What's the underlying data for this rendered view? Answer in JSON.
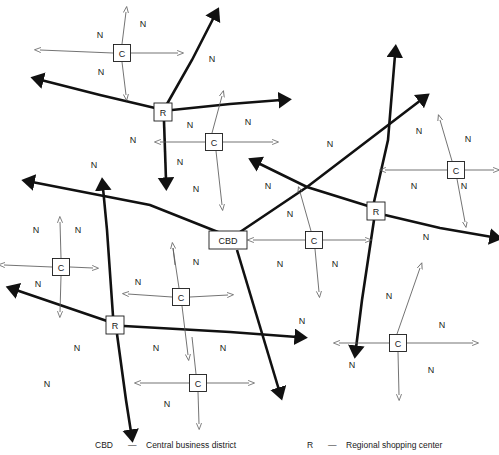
{
  "diagram": {
    "colors": {
      "arterial": "#111111",
      "local": "#5a5a5a",
      "text": "#1a1a1a",
      "background": "#ffffff"
    },
    "nodes": [
      {
        "id": "cbd",
        "label": "CBD",
        "x": 228,
        "y": 240,
        "w": 38,
        "h": 18,
        "type": "central-business-district"
      },
      {
        "id": "r-northwest",
        "label": "R",
        "x": 163,
        "y": 112,
        "w": 18,
        "h": 18,
        "type": "regional-shopping-center"
      },
      {
        "id": "r-east",
        "label": "R",
        "x": 376,
        "y": 211,
        "w": 18,
        "h": 18,
        "type": "regional-shopping-center"
      },
      {
        "id": "r-southwest",
        "label": "R",
        "x": 115,
        "y": 325,
        "w": 18,
        "h": 18,
        "type": "regional-shopping-center"
      },
      {
        "id": "c-top",
        "label": "C",
        "x": 122,
        "y": 53,
        "w": 17,
        "h": 17,
        "type": "community-shopping-center"
      },
      {
        "id": "c-upper-mid",
        "label": "C",
        "x": 214,
        "y": 142,
        "w": 17,
        "h": 17,
        "type": "community-shopping-center"
      },
      {
        "id": "c-right",
        "label": "C",
        "x": 456,
        "y": 170,
        "w": 17,
        "h": 17,
        "type": "community-shopping-center"
      },
      {
        "id": "c-center",
        "label": "C",
        "x": 314,
        "y": 240,
        "w": 17,
        "h": 17,
        "type": "community-shopping-center"
      },
      {
        "id": "c-left",
        "label": "C",
        "x": 61,
        "y": 267,
        "w": 17,
        "h": 17,
        "type": "community-shopping-center"
      },
      {
        "id": "c-mid-left",
        "label": "C",
        "x": 181,
        "y": 297,
        "w": 17,
        "h": 17,
        "type": "community-shopping-center"
      },
      {
        "id": "c-lower-right",
        "label": "C",
        "x": 398,
        "y": 343,
        "w": 17,
        "h": 17,
        "type": "community-shopping-center"
      },
      {
        "id": "c-bottom",
        "label": "C",
        "x": 198,
        "y": 383,
        "w": 17,
        "h": 17,
        "type": "community-shopping-center"
      }
    ],
    "arterial_roads": [
      {
        "name": "cbd-to-northwest",
        "points": [
          [
            228,
            236
          ],
          [
            150,
            205
          ],
          [
            32,
            182
          ]
        ],
        "arrow_at_end": true
      },
      {
        "name": "cbd-to-northeast",
        "points": [
          [
            240,
            232
          ],
          [
            307,
            187
          ],
          [
            421,
            100
          ]
        ],
        "arrow_at_end": true
      },
      {
        "name": "cbd-to-southeast",
        "points": [
          [
            237,
            250
          ],
          [
            279,
            390
          ]
        ],
        "arrow_at_end": true
      },
      {
        "name": "r-northwest-to-west",
        "points": [
          [
            155,
            108
          ],
          [
            100,
            95
          ],
          [
            41,
            80
          ]
        ],
        "arrow_at_end": true
      },
      {
        "name": "r-northwest-to-northeast",
        "points": [
          [
            167,
            104
          ],
          [
            192,
            60
          ],
          [
            214,
            17
          ]
        ],
        "arrow_at_end": true
      },
      {
        "name": "r-northwest-to-east",
        "points": [
          [
            172,
            110
          ],
          [
            230,
            104
          ],
          [
            281,
            100
          ]
        ],
        "arrow_at_end": true
      },
      {
        "name": "r-northwest-to-south",
        "points": [
          [
            164,
            121
          ],
          [
            166,
            180
          ]
        ],
        "arrow_at_end": true
      },
      {
        "name": "r-east-to-northwest",
        "points": [
          [
            368,
            206
          ],
          [
            307,
            187
          ],
          [
            258,
            163
          ]
        ],
        "arrow_at_end": true
      },
      {
        "name": "r-east-to-north",
        "points": [
          [
            374,
            202
          ],
          [
            388,
            140
          ],
          [
            395,
            55
          ]
        ],
        "arrow_at_end": true
      },
      {
        "name": "r-east-to-southeast",
        "points": [
          [
            385,
            215
          ],
          [
            440,
            228
          ],
          [
            492,
            237
          ]
        ],
        "arrow_at_end": true
      },
      {
        "name": "r-east-to-south",
        "points": [
          [
            374,
            220
          ],
          [
            362,
            300
          ],
          [
            356,
            348
          ]
        ],
        "arrow_at_end": true
      },
      {
        "name": "r-southwest-to-west",
        "points": [
          [
            107,
            321
          ],
          [
            60,
            305
          ],
          [
            16,
            290
          ]
        ],
        "arrow_at_end": true
      },
      {
        "name": "r-southwest-to-north",
        "points": [
          [
            113,
            316
          ],
          [
            107,
            230
          ],
          [
            103,
            188
          ]
        ],
        "arrow_at_end": true
      },
      {
        "name": "r-southwest-to-east",
        "points": [
          [
            124,
            326
          ],
          [
            230,
            332
          ],
          [
            297,
            337
          ]
        ],
        "arrow_at_end": true
      },
      {
        "name": "r-southwest-to-south",
        "points": [
          [
            117,
            334
          ],
          [
            126,
            400
          ],
          [
            131,
            432
          ]
        ],
        "arrow_at_end": true
      }
    ],
    "local_roads": [
      {
        "name": "c-top-north",
        "points": [
          [
            122,
            44
          ],
          [
            126,
            12
          ]
        ],
        "arrow_at_end": true
      },
      {
        "name": "c-top-south",
        "points": [
          [
            122,
            62
          ],
          [
            126,
            95
          ]
        ],
        "arrow_at_end": true
      },
      {
        "name": "c-top-west",
        "points": [
          [
            113,
            53
          ],
          [
            40,
            50
          ]
        ],
        "arrow_at_end": true
      },
      {
        "name": "c-top-east",
        "points": [
          [
            131,
            53
          ],
          [
            178,
            53
          ]
        ],
        "arrow_at_end": true
      },
      {
        "name": "c-upper-mid-north",
        "points": [
          [
            212,
            133
          ],
          [
            222,
            96
          ]
        ],
        "arrow_at_end": true
      },
      {
        "name": "c-upper-mid-south",
        "points": [
          [
            216,
            151
          ],
          [
            222,
            205
          ]
        ],
        "arrow_at_end": true
      },
      {
        "name": "c-upper-mid-west",
        "points": [
          [
            205,
            142
          ],
          [
            160,
            142
          ]
        ],
        "arrow_at_end": true
      },
      {
        "name": "c-upper-mid-east",
        "points": [
          [
            223,
            142
          ],
          [
            273,
            142
          ]
        ],
        "arrow_at_end": true
      },
      {
        "name": "c-right-north",
        "points": [
          [
            452,
            161
          ],
          [
            440,
            120
          ]
        ],
        "arrow_at_end": true
      },
      {
        "name": "c-right-south",
        "points": [
          [
            457,
            179
          ],
          [
            465,
            222
          ]
        ],
        "arrow_at_end": true
      },
      {
        "name": "c-right-west",
        "points": [
          [
            447,
            170
          ],
          [
            385,
            170
          ]
        ],
        "arrow_at_end": true
      },
      {
        "name": "c-right-east",
        "points": [
          [
            465,
            170
          ],
          [
            494,
            170
          ]
        ],
        "arrow_at_end": true
      },
      {
        "name": "c-center-north",
        "points": [
          [
            311,
            231
          ],
          [
            300,
            192
          ]
        ],
        "arrow_at_end": true
      },
      {
        "name": "c-center-south",
        "points": [
          [
            315,
            249
          ],
          [
            319,
            292
          ]
        ],
        "arrow_at_end": true
      },
      {
        "name": "c-center-west",
        "points": [
          [
            305,
            240
          ],
          [
            253,
            240
          ]
        ],
        "arrow_at_end": true
      },
      {
        "name": "c-center-east",
        "points": [
          [
            323,
            240
          ],
          [
            366,
            240
          ]
        ],
        "arrow_at_end": true
      },
      {
        "name": "c-left-north",
        "points": [
          [
            61,
            258
          ],
          [
            60,
            222
          ]
        ],
        "arrow_at_end": true
      },
      {
        "name": "c-left-south",
        "points": [
          [
            61,
            276
          ],
          [
            60,
            312
          ]
        ],
        "arrow_at_end": true
      },
      {
        "name": "c-left-west",
        "points": [
          [
            52,
            267
          ],
          [
            4,
            265
          ]
        ],
        "arrow_at_end": true
      },
      {
        "name": "c-left-east",
        "points": [
          [
            70,
            267
          ],
          [
            93,
            268
          ]
        ],
        "arrow_at_end": true
      },
      {
        "name": "c-mid-left-north",
        "points": [
          [
            179,
            288
          ],
          [
            173,
            248
          ]
        ],
        "arrow_at_end": false
      },
      {
        "name": "c-mid-left-south",
        "points": [
          [
            182,
            306
          ],
          [
            188,
            355
          ]
        ],
        "arrow_at_end": true
      },
      {
        "name": "c-mid-left-west",
        "points": [
          [
            172,
            297
          ],
          [
            128,
            294
          ]
        ],
        "arrow_at_end": true
      },
      {
        "name": "c-mid-left-east",
        "points": [
          [
            190,
            297
          ],
          [
            228,
            295
          ]
        ],
        "arrow_at_end": true
      },
      {
        "name": "c-lower-right-north",
        "points": [
          [
            397,
            334
          ],
          [
            420,
            268
          ]
        ],
        "arrow_at_end": true
      },
      {
        "name": "c-lower-right-south",
        "points": [
          [
            398,
            352
          ],
          [
            399,
            395
          ]
        ],
        "arrow_at_end": true
      },
      {
        "name": "c-lower-right-west",
        "points": [
          [
            389,
            343
          ],
          [
            339,
            343
          ]
        ],
        "arrow_at_end": true
      },
      {
        "name": "c-lower-right-east",
        "points": [
          [
            407,
            343
          ],
          [
            473,
            343
          ]
        ],
        "arrow_at_end": true
      },
      {
        "name": "c-bottom-north",
        "points": [
          [
            196,
            374
          ],
          [
            192,
            337
          ]
        ],
        "arrow_at_end": false
      },
      {
        "name": "c-bottom-south",
        "points": [
          [
            198,
            392
          ],
          [
            199,
            424
          ]
        ],
        "arrow_at_end": true
      },
      {
        "name": "c-bottom-west",
        "points": [
          [
            189,
            383
          ],
          [
            140,
            383
          ]
        ],
        "arrow_at_end": true
      },
      {
        "name": "c-bottom-east",
        "points": [
          [
            207,
            383
          ],
          [
            249,
            383
          ]
        ],
        "arrow_at_end": true
      },
      {
        "name": "cbd-feeder-from-c-mid-left",
        "points": [
          [
            175,
            265
          ],
          [
            173,
            248
          ]
        ],
        "arrow_at_end": true
      }
    ],
    "neighborhood_labels": [
      {
        "text": "N",
        "x": 143,
        "y": 25
      },
      {
        "text": "N",
        "x": 100,
        "y": 36
      },
      {
        "text": "N",
        "x": 101,
        "y": 73
      },
      {
        "text": "N",
        "x": 212,
        "y": 60
      },
      {
        "text": "N",
        "x": 133,
        "y": 141
      },
      {
        "text": "N",
        "x": 190,
        "y": 126
      },
      {
        "text": "N",
        "x": 248,
        "y": 123
      },
      {
        "text": "N",
        "x": 94,
        "y": 166
      },
      {
        "text": "N",
        "x": 180,
        "y": 163
      },
      {
        "text": "N",
        "x": 196,
        "y": 190
      },
      {
        "text": "N",
        "x": 268,
        "y": 187
      },
      {
        "text": "N",
        "x": 330,
        "y": 145
      },
      {
        "text": "N",
        "x": 419,
        "y": 132
      },
      {
        "text": "N",
        "x": 468,
        "y": 140
      },
      {
        "text": "N",
        "x": 414,
        "y": 187
      },
      {
        "text": "N",
        "x": 464,
        "y": 187
      },
      {
        "text": "N",
        "x": 426,
        "y": 238
      },
      {
        "text": "N",
        "x": 290,
        "y": 215
      },
      {
        "text": "N",
        "x": 280,
        "y": 265
      },
      {
        "text": "N",
        "x": 335,
        "y": 265
      },
      {
        "text": "N",
        "x": 302,
        "y": 322
      },
      {
        "text": "N",
        "x": 36,
        "y": 231
      },
      {
        "text": "N",
        "x": 78,
        "y": 231
      },
      {
        "text": "N",
        "x": 38,
        "y": 285
      },
      {
        "text": "N",
        "x": 138,
        "y": 283
      },
      {
        "text": "N",
        "x": 196,
        "y": 263
      },
      {
        "text": "N",
        "x": 77,
        "y": 349
      },
      {
        "text": "N",
        "x": 47,
        "y": 385
      },
      {
        "text": "N",
        "x": 156,
        "y": 349
      },
      {
        "text": "N",
        "x": 223,
        "y": 349
      },
      {
        "text": "N",
        "x": 167,
        "y": 405
      },
      {
        "text": "N",
        "x": 389,
        "y": 297
      },
      {
        "text": "N",
        "x": 352,
        "y": 366
      },
      {
        "text": "N",
        "x": 442,
        "y": 326
      },
      {
        "text": "N",
        "x": 431,
        "y": 371
      }
    ]
  },
  "legend": {
    "entries": [
      {
        "key": "CBD",
        "dash": "—",
        "text": "Central business district",
        "key_x": 95,
        "dash_x": 128,
        "text_x": 146
      },
      {
        "key": "R",
        "dash": "—",
        "text": "Regional shopping center",
        "key_x": 307,
        "dash_x": 328,
        "text_x": 346
      }
    ]
  }
}
